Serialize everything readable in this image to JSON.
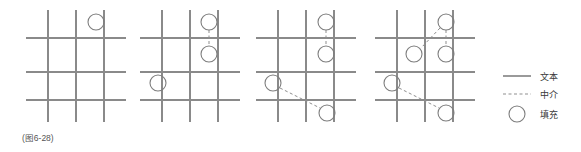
{
  "figure": {
    "caption": "(图6-28)",
    "background": "#ffffff",
    "grid_color": "#8a8a8a",
    "circle_color": "#7d7d7d",
    "dash_color": "#8f8f8f",
    "text_color": "#3a3a3a"
  },
  "legend": {
    "items": [
      {
        "key": "solid-line",
        "symbol": "line-solid",
        "label": "文本"
      },
      {
        "key": "dashed-line",
        "symbol": "line-dashed",
        "label": "中介"
      },
      {
        "key": "circle",
        "symbol": "circle-outline",
        "label": "填充"
      }
    ]
  },
  "panels": [
    {
      "index": 1,
      "name": "panel-step-1",
      "circle_count": 1,
      "link_count": 0,
      "circles": [
        {
          "id": "p1-c1",
          "cx": 96,
          "cy": 22,
          "r": 8
        }
      ],
      "links": []
    },
    {
      "index": 2,
      "name": "panel-step-2",
      "circle_count": 3,
      "link_count": 1,
      "circles": [
        {
          "id": "p2-c1",
          "cx": 209,
          "cy": 22,
          "r": 8
        },
        {
          "id": "p2-c2",
          "cx": 209,
          "cy": 54,
          "r": 8
        },
        {
          "id": "p2-c3",
          "cx": 158,
          "cy": 83,
          "r": 8
        }
      ],
      "links": [
        {
          "id": "p2-l1",
          "from": "p2-c1",
          "to": "p2-c2",
          "x1": 209,
          "y1": 30,
          "x2": 209,
          "y2": 46
        }
      ]
    },
    {
      "index": 3,
      "name": "panel-step-3",
      "circle_count": 4,
      "link_count": 2,
      "circles": [
        {
          "id": "p3-c1",
          "cx": 326,
          "cy": 22,
          "r": 8
        },
        {
          "id": "p3-c2",
          "cx": 326,
          "cy": 54,
          "r": 8
        },
        {
          "id": "p3-c3",
          "cx": 273,
          "cy": 83,
          "r": 8
        },
        {
          "id": "p3-c4",
          "cx": 327,
          "cy": 113,
          "r": 8
        }
      ],
      "links": [
        {
          "id": "p3-l1",
          "from": "p3-c1",
          "to": "p3-c2",
          "x1": 326,
          "y1": 30,
          "x2": 326,
          "y2": 46
        },
        {
          "id": "p3-l2",
          "from": "p3-c3",
          "to": "p3-c4",
          "x1": 280,
          "y1": 88,
          "x2": 320,
          "y2": 108
        }
      ]
    },
    {
      "index": 4,
      "name": "panel-step-4",
      "circle_count": 5,
      "link_count": 3,
      "circles": [
        {
          "id": "p4-c1",
          "cx": 446,
          "cy": 22,
          "r": 8
        },
        {
          "id": "p4-c2",
          "cx": 446,
          "cy": 54,
          "r": 8
        },
        {
          "id": "p4-c3",
          "cx": 414,
          "cy": 54,
          "r": 8
        },
        {
          "id": "p4-c4",
          "cx": 392,
          "cy": 83,
          "r": 8
        },
        {
          "id": "p4-c5",
          "cx": 446,
          "cy": 113,
          "r": 8
        }
      ],
      "links": [
        {
          "id": "p4-l1",
          "from": "p4-c1",
          "to": "p4-c2",
          "x1": 446,
          "y1": 30,
          "x2": 446,
          "y2": 46
        },
        {
          "id": "p4-l2",
          "from": "p4-c1",
          "to": "p4-c3",
          "x1": 440,
          "y1": 28,
          "x2": 421,
          "y2": 48
        },
        {
          "id": "p4-l3",
          "from": "p4-c4",
          "to": "p4-c5",
          "x1": 399,
          "y1": 88,
          "x2": 439,
          "y2": 108
        }
      ]
    }
  ],
  "grid_geometry": {
    "panel_origins_x": [
      22,
      136,
      252,
      371
    ],
    "vertical_line_offsets": [
      26,
      54,
      82
    ],
    "horizontal_line_offsets": [
      38,
      72,
      100
    ],
    "vertical_span": [
      10,
      122
    ],
    "horizontal_span": [
      4,
      104
    ]
  }
}
